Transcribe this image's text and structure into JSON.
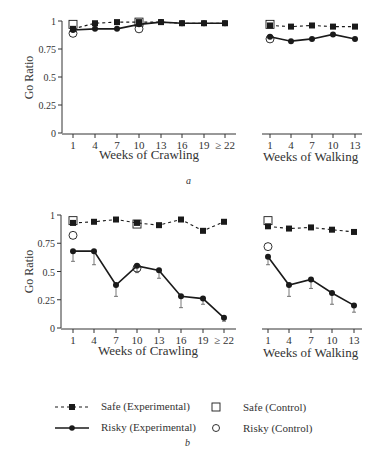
{
  "chart_data": [
    {
      "panel": "a",
      "type": "line",
      "ylabel": "Go Ratio",
      "ylim": [
        0,
        1
      ],
      "yticks": [
        "0",
        "0.25",
        "0.5",
        "0.75",
        "1"
      ],
      "subplots": [
        {
          "xlabel": "Weeks of Crawling",
          "categories": [
            "1",
            "4",
            "7",
            "10",
            "13",
            "16",
            "19",
            "≥ 22"
          ],
          "series": [
            {
              "name": "Safe (Experimental)",
              "style": "dashed-square",
              "values": [
                0.93,
                0.98,
                0.99,
                0.99,
                0.99,
                0.98,
                0.98,
                0.98
              ]
            },
            {
              "name": "Risky (Experimental)",
              "style": "solid-circle",
              "values": [
                0.92,
                0.93,
                0.93,
                0.97,
                0.99,
                0.98,
                0.98,
                0.98
              ]
            },
            {
              "name": "Safe (Control)",
              "style": "open-square",
              "points": [
                {
                  "x": "1",
                  "y": 0.97
                },
                {
                  "x": "10",
                  "y": 0.99
                }
              ]
            },
            {
              "name": "Risky (Control)",
              "style": "open-circle",
              "points": [
                {
                  "x": "1",
                  "y": 0.89
                },
                {
                  "x": "10",
                  "y": 0.93
                }
              ]
            }
          ]
        },
        {
          "xlabel": "Weeks of Walking",
          "categories": [
            "1",
            "4",
            "7",
            "10",
            "13"
          ],
          "series": [
            {
              "name": "Safe (Experimental)",
              "style": "dashed-square",
              "values": [
                0.96,
                0.95,
                0.96,
                0.95,
                0.95
              ]
            },
            {
              "name": "Risky (Experimental)",
              "style": "solid-circle",
              "values": [
                0.86,
                0.82,
                0.84,
                0.88,
                0.84
              ]
            },
            {
              "name": "Safe (Control)",
              "style": "open-square",
              "points": [
                {
                  "x": "1",
                  "y": 0.97
                }
              ]
            },
            {
              "name": "Risky (Control)",
              "style": "open-circle",
              "points": [
                {
                  "x": "1",
                  "y": 0.84
                }
              ]
            }
          ]
        }
      ]
    },
    {
      "panel": "b",
      "type": "line",
      "ylabel": "Go Ratio",
      "ylim": [
        0,
        1
      ],
      "yticks": [
        "0",
        "0.25",
        "0.5",
        "0.75",
        "1"
      ],
      "subplots": [
        {
          "xlabel": "Weeks of Crawling",
          "categories": [
            "1",
            "4",
            "7",
            "10",
            "13",
            "16",
            "19",
            "≥ 22"
          ],
          "series": [
            {
              "name": "Safe (Experimental)",
              "style": "dashed-square",
              "values": [
                0.93,
                0.94,
                0.96,
                0.93,
                0.91,
                0.96,
                0.86,
                0.94
              ]
            },
            {
              "name": "Risky (Experimental)",
              "style": "solid-circle",
              "values": [
                0.68,
                0.68,
                0.38,
                0.55,
                0.51,
                0.28,
                0.26,
                0.09
              ],
              "error_low": [
                0.09,
                0.12,
                0.1,
                0.06,
                0.07,
                0.1,
                0.05,
                0.03
              ]
            },
            {
              "name": "Safe (Control)",
              "style": "open-square",
              "points": [
                {
                  "x": "1",
                  "y": 0.95
                },
                {
                  "x": "10",
                  "y": 0.92
                }
              ]
            },
            {
              "name": "Risky (Control)",
              "style": "open-circle",
              "points": [
                {
                  "x": "1",
                  "y": 0.82
                },
                {
                  "x": "10",
                  "y": 0.53
                }
              ]
            }
          ]
        },
        {
          "xlabel": "Weeks of Walking",
          "categories": [
            "1",
            "4",
            "7",
            "10",
            "13"
          ],
          "series": [
            {
              "name": "Safe (Experimental)",
              "style": "dashed-square",
              "values": [
                0.9,
                0.88,
                0.89,
                0.87,
                0.85
              ]
            },
            {
              "name": "Risky (Experimental)",
              "style": "solid-circle",
              "values": [
                0.63,
                0.38,
                0.43,
                0.31,
                0.2
              ],
              "error_low": [
                0.07,
                0.1,
                0.08,
                0.1,
                0.06
              ]
            },
            {
              "name": "Safe (Control)",
              "style": "open-square",
              "points": [
                {
                  "x": "1",
                  "y": 0.95
                }
              ]
            },
            {
              "name": "Risky (Control)",
              "style": "open-circle",
              "points": [
                {
                  "x": "1",
                  "y": 0.72
                }
              ]
            }
          ]
        }
      ]
    }
  ],
  "labels": {
    "ylabel": "Go Ratio",
    "crawling_xlabel": "Weeks of Crawling",
    "walking_xlabel": "Weeks of Walking",
    "panel_a": "a",
    "panel_b": "b",
    "crawl_ticks": [
      "1",
      "4",
      "7",
      "10",
      "13",
      "16",
      "19",
      "≥ 22"
    ],
    "walk_ticks": [
      "1",
      "4",
      "7",
      "10",
      "13"
    ],
    "yticks": [
      "1",
      "0.75",
      "0.5",
      "0.25",
      "0"
    ]
  },
  "legend": {
    "items": [
      {
        "label": "Safe (Experimental)",
        "symbol": "dashed-line-filled-square"
      },
      {
        "label": "Risky (Experimental)",
        "symbol": "solid-line-filled-circle"
      },
      {
        "label": "Safe (Control)",
        "symbol": "open-square"
      },
      {
        "label": "Risky (Control)",
        "symbol": "open-circle"
      }
    ]
  },
  "colors": {
    "ink": "#1a1a1a",
    "axis": "#333333",
    "text": "#333333",
    "background": "#ffffff"
  }
}
